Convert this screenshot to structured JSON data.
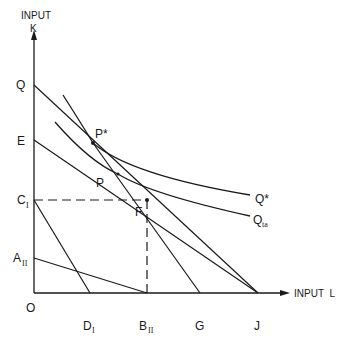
{
  "diagram": {
    "type": "isoquant-diagram",
    "axes": {
      "y_title_line1": "INPUT",
      "y_title_line2": "K",
      "x_title": "INPUT  L",
      "origin_label": "O"
    },
    "y_axis_points": [
      {
        "id": "Q",
        "label": "Q",
        "sub": ""
      },
      {
        "id": "E",
        "label": "E",
        "sub": ""
      },
      {
        "id": "C_I",
        "label": "C",
        "sub": "I"
      },
      {
        "id": "A_II",
        "label": "A",
        "sub": "II"
      }
    ],
    "x_axis_points": [
      {
        "id": "D_I",
        "label": "D",
        "sub": "I"
      },
      {
        "id": "B_II",
        "label": "B",
        "sub": "II"
      },
      {
        "id": "G",
        "label": "G",
        "sub": ""
      },
      {
        "id": "J",
        "label": "J",
        "sub": ""
      }
    ],
    "interior_points": [
      {
        "id": "P_star",
        "label": "P*"
      },
      {
        "id": "P",
        "label": "P"
      },
      {
        "id": "F",
        "label": "F"
      }
    ],
    "curves": [
      {
        "id": "Q_star",
        "label": "Q*",
        "sub": ""
      },
      {
        "id": "Q_ta",
        "label": "Q",
        "sub": "ta"
      }
    ],
    "lines": [
      {
        "from": "Q",
        "to": "J"
      },
      {
        "from": "E",
        "to": "J"
      },
      {
        "from": "C_I",
        "to": "D_I"
      },
      {
        "from": "A_II",
        "to": "B_II"
      },
      {
        "from": "P_star",
        "to": "G"
      }
    ],
    "dashed_lines": [
      {
        "from": "C_I",
        "to": "F"
      },
      {
        "from": "F",
        "to": "B_II"
      }
    ],
    "colors": {
      "ink": "#1a1a1a",
      "background": "#ffffff"
    }
  }
}
